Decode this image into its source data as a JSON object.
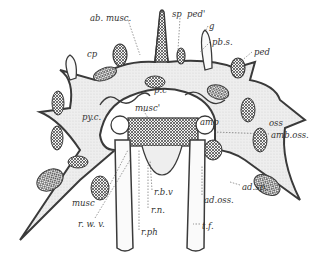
{
  "figure": {
    "colors": {
      "ink": "#3a3a3a",
      "stipple": "#e6e6e6",
      "paper": "#ffffff"
    }
  },
  "labels": [
    {
      "id": "ab-musc",
      "text": "ab. musc.",
      "x": 90,
      "y": 14
    },
    {
      "id": "sp",
      "text": "sp",
      "x": 172,
      "y": 10
    },
    {
      "id": "ped-prime",
      "text": "ped'",
      "x": 187,
      "y": 10
    },
    {
      "id": "g",
      "text": "g",
      "x": 209,
      "y": 22
    },
    {
      "id": "pb-s",
      "text": "pb.s.",
      "x": 212,
      "y": 38
    },
    {
      "id": "cp",
      "text": "cp",
      "x": 87,
      "y": 50
    },
    {
      "id": "ped",
      "text": "ped",
      "x": 254,
      "y": 48
    },
    {
      "id": "p-c",
      "text": "p.c",
      "x": 154,
      "y": 86
    },
    {
      "id": "musc-prime",
      "text": "musc'",
      "x": 135,
      "y": 104
    },
    {
      "id": "py-c",
      "text": "py.c.",
      "x": 82,
      "y": 113
    },
    {
      "id": "amp",
      "text": "amp",
      "x": 200,
      "y": 118
    },
    {
      "id": "oss",
      "text": "oss",
      "x": 269,
      "y": 119
    },
    {
      "id": "amb-oss",
      "text": "amb.oss.",
      "x": 271,
      "y": 131
    },
    {
      "id": "ad-sp",
      "text": "ad.sp.",
      "x": 242,
      "y": 183
    },
    {
      "id": "ad-oss",
      "text": "ad.oss.",
      "x": 204,
      "y": 196
    },
    {
      "id": "musc",
      "text": "musc",
      "x": 72,
      "y": 199
    },
    {
      "id": "r-b-v",
      "text": "r.b.v",
      "x": 154,
      "y": 188
    },
    {
      "id": "r-n",
      "text": "r.n.",
      "x": 151,
      "y": 206
    },
    {
      "id": "r-w-v",
      "text": "r. w. v.",
      "x": 78,
      "y": 220
    },
    {
      "id": "t-f",
      "text": "t.f.",
      "x": 202,
      "y": 222
    },
    {
      "id": "r-ph",
      "text": "r.ph",
      "x": 141,
      "y": 228
    }
  ]
}
